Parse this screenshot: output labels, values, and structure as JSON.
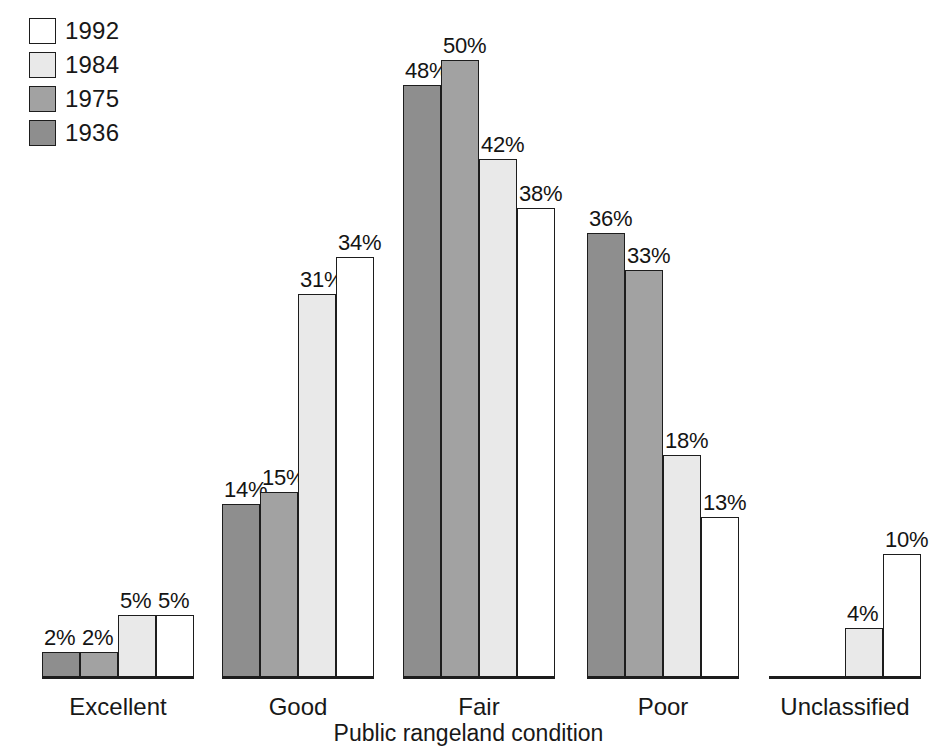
{
  "chart_data": {
    "type": "bar",
    "title": "",
    "xlabel": "Public rangeland condition",
    "ylabel": "",
    "ylim": [
      0,
      52
    ],
    "grid": false,
    "legend_position": "top-left",
    "value_suffix": "%",
    "categories": [
      "Excellent",
      "Good",
      "Fair",
      "Poor",
      "Unclassified"
    ],
    "series": [
      {
        "name": "1936",
        "color": "#8e8e8e",
        "values": [
          2,
          14,
          48,
          36,
          0
        ]
      },
      {
        "name": "1975",
        "color": "#a2a2a2",
        "values": [
          2,
          15,
          50,
          33,
          0
        ]
      },
      {
        "name": "1984",
        "color": "#e9e9e9",
        "values": [
          5,
          31,
          42,
          18,
          4
        ]
      },
      {
        "name": "1992",
        "color": "#ffffff",
        "values": [
          5,
          34,
          38,
          13,
          10
        ]
      }
    ],
    "data_labels": {
      "Excellent": [
        "2%",
        "2%",
        "5%",
        "5%"
      ],
      "Good": [
        "14%",
        "15%",
        "31%",
        "34%"
      ],
      "Fair": [
        "48%",
        "50%",
        "42%",
        "38%"
      ],
      "Poor": [
        "36%",
        "33%",
        "18%",
        "13%"
      ],
      "Unclassified": [
        "",
        "",
        "4%",
        "10%"
      ]
    }
  },
  "legend": {
    "items": [
      {
        "label": "1992",
        "color": "#ffffff"
      },
      {
        "label": "1984",
        "color": "#e9e9e9"
      },
      {
        "label": "1975",
        "color": "#a2a2a2"
      },
      {
        "label": "1936",
        "color": "#8e8e8e"
      }
    ]
  },
  "axis": {
    "title": "Public rangeland condition",
    "baseline_color": "#1d1d1d"
  },
  "layout": {
    "groups": [
      {
        "name": "Excellent",
        "left": 42,
        "width": 152
      },
      {
        "name": "Good",
        "left": 222,
        "width": 152
      },
      {
        "name": "Fair",
        "left": 403,
        "width": 152
      },
      {
        "name": "Poor",
        "left": 587,
        "width": 152
      },
      {
        "name": "Unclassified",
        "left": 769,
        "width": 152
      }
    ],
    "px_per_percent": 12.34,
    "baseline_y": 677
  }
}
